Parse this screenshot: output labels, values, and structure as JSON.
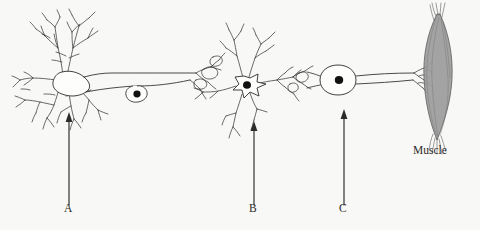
{
  "figure": {
    "background_color": "#f8f8f6",
    "ink_color": "#2b2b2b",
    "width": 480,
    "height": 230
  },
  "labels": {
    "a": "A",
    "b": "B",
    "c": "C",
    "muscle": "Muscle"
  },
  "pointers": [
    {
      "id": "a",
      "label": "A",
      "x": 69,
      "tail_y": 205,
      "head_y": 113
    },
    {
      "id": "b",
      "label": "B",
      "x": 254,
      "tail_y": 205,
      "head_y": 122
    },
    {
      "id": "c",
      "label": "C",
      "x": 344,
      "tail_y": 205,
      "head_y": 110
    }
  ],
  "structures": [
    {
      "name": "dendrite-tree-neuron-1",
      "description": "Branching dendrites of first neuron"
    },
    {
      "name": "soma-neuron-1",
      "description": "Cell body of first neuron"
    },
    {
      "name": "axon-neuron-1",
      "description": "Long axon of first neuron"
    },
    {
      "name": "schwann-cell-nucleus",
      "description": "Oval nucleus bulge on axon"
    },
    {
      "name": "axon-terminal-neuron-1",
      "description": "Terminal branches contacting neuron 2"
    },
    {
      "name": "soma-neuron-2",
      "description": "Star shaped multipolar cell body"
    },
    {
      "name": "axon-terminal-neuron-2",
      "description": "Terminal branches contacting neuron 3"
    },
    {
      "name": "soma-neuron-3",
      "description": "Oval cell body of motor neuron"
    },
    {
      "name": "axon-neuron-3",
      "description": "Motor axon running to muscle"
    },
    {
      "name": "neuromuscular-junction",
      "description": "Motor end plate on muscle"
    },
    {
      "name": "muscle-body",
      "description": "Spindle shaped skeletal muscle"
    }
  ],
  "colors": {
    "ink": "#2b2b2b",
    "muscle_fill": "#9c9c9c",
    "muscle_stroke": "#5d5d5d",
    "nucleus_fill": "#111111",
    "background": "#f8f8f6"
  }
}
